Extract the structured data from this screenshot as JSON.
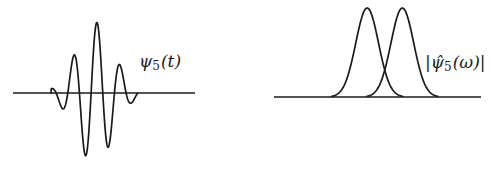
{
  "chart_data": [
    {
      "type": "line",
      "title": "",
      "label": {
        "symbol": "ψ",
        "subscript": "5",
        "argument": "(t)",
        "text": "ψ5(t)"
      },
      "description": "Time-domain wavelet: Gaussian-windowed oscillation centered near t=0, roughly 4 full oscillations visible",
      "xlabel": "",
      "ylabel": "",
      "axes": {
        "x_axis_visible": true,
        "y_axis_visible": false,
        "ticks": false,
        "grid": false
      },
      "model": {
        "form": "envelope * cos(omega*t + phase)",
        "envelope": "gaussian",
        "center": 0.0,
        "sigma": 1.0,
        "omega": 5.0,
        "phase": -0.6
      },
      "extrema": [
        {
          "t": -2.1,
          "y": -0.04
        },
        {
          "t": -1.48,
          "y": 0.33
        },
        {
          "t": -0.94,
          "y": -0.76
        },
        {
          "t": -0.35,
          "y": 1.0
        },
        {
          "t": 0.24,
          "y": -1.0
        },
        {
          "t": 0.81,
          "y": 0.63
        },
        {
          "t": 1.4,
          "y": -0.23
        },
        {
          "t": 2.05,
          "y": 0.03
        }
      ],
      "x_range": [
        -4.4,
        5.4
      ],
      "y_range": [
        -1.0,
        1.0
      ]
    },
    {
      "type": "line",
      "title": "",
      "label": {
        "symbol": "ψ̂",
        "subscript": "5",
        "argument": "(ω)",
        "text": "|ψ̂5(ω)|"
      },
      "description": "Frequency-domain magnitude: two narrow Gaussian bumps of equal height on the positive frequency axis",
      "xlabel": "",
      "ylabel": "",
      "axes": {
        "x_axis_visible": true,
        "y_axis_visible": false,
        "ticks": false,
        "grid": false
      },
      "peaks": [
        {
          "omega": 0.45,
          "height": 1.0,
          "sigma": 0.055
        },
        {
          "omega": 0.62,
          "height": 1.0,
          "sigma": 0.055
        }
      ],
      "x_range": [
        0.0,
        1.0
      ],
      "y_range": [
        0.0,
        1.0
      ]
    }
  ]
}
